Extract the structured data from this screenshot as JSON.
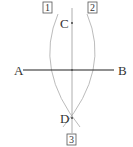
{
  "diagram": {
    "type": "perpendicular-bisector-construction",
    "points": {
      "A": "A",
      "B": "B",
      "C": "C",
      "D": "D"
    },
    "step_labels": [
      "1",
      "2",
      "3"
    ],
    "colors": {
      "segment": "#222222",
      "construction": "#999999",
      "text": "#333333"
    }
  }
}
